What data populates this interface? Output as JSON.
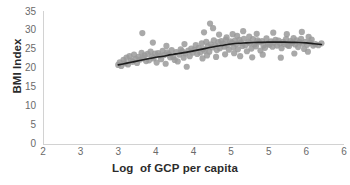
{
  "chart_data": {
    "type": "scatter",
    "title": "",
    "xlabel": "Log  of GCP per capita",
    "ylabel": "BMI Index",
    "xlim": [
      2,
      6
    ],
    "ylim": [
      0,
      35
    ],
    "grid": false,
    "legend": null,
    "xticks": [
      2,
      2.5,
      3,
      3.5,
      4,
      4.5,
      5,
      5.5,
      6
    ],
    "xtick_labels": [
      "2",
      "3",
      "3",
      "4",
      "4",
      "5",
      "5",
      "6"
    ],
    "yticks": [
      0,
      5,
      10,
      15,
      20,
      25,
      30,
      35
    ],
    "ytick_labels": [
      "0",
      "5",
      "10",
      "15",
      "20",
      "25",
      "30",
      "35"
    ],
    "marker": {
      "color": "#9a9a9a",
      "shape": "circle",
      "size": 3.1,
      "opacity": 0.85
    },
    "trendline": {
      "color": "#1c1c1c",
      "width": 1.6,
      "style": "solid",
      "kind": "smoothed-fit"
    },
    "series": [
      {
        "name": "Countries",
        "points": [
          [
            3.0,
            20.9
          ],
          [
            3.02,
            21.6
          ],
          [
            3.04,
            20.6
          ],
          [
            3.07,
            22.2
          ],
          [
            3.09,
            21.3
          ],
          [
            3.11,
            22.8
          ],
          [
            3.13,
            21.0
          ],
          [
            3.15,
            23.2
          ],
          [
            3.17,
            22.0
          ],
          [
            3.19,
            21.7
          ],
          [
            3.21,
            23.6
          ],
          [
            3.23,
            22.5
          ],
          [
            3.25,
            21.4
          ],
          [
            3.27,
            23.0
          ],
          [
            3.29,
            22.3
          ],
          [
            3.31,
            24.1
          ],
          [
            3.33,
            22.7
          ],
          [
            3.35,
            23.4
          ],
          [
            3.37,
            21.9
          ],
          [
            3.39,
            23.8
          ],
          [
            3.41,
            22.1
          ],
          [
            3.43,
            24.4
          ],
          [
            3.45,
            23.1
          ],
          [
            3.47,
            22.6
          ],
          [
            3.49,
            23.9
          ],
          [
            3.51,
            21.5
          ],
          [
            3.53,
            24.0
          ],
          [
            3.55,
            23.3
          ],
          [
            3.57,
            22.4
          ],
          [
            3.59,
            24.6
          ],
          [
            3.61,
            23.5
          ],
          [
            3.63,
            21.2
          ],
          [
            3.65,
            24.2
          ],
          [
            3.67,
            23.7
          ],
          [
            3.69,
            22.9
          ],
          [
            3.71,
            24.8
          ],
          [
            3.73,
            23.0
          ],
          [
            3.75,
            22.2
          ],
          [
            3.77,
            24.3
          ],
          [
            3.79,
            21.8
          ],
          [
            3.81,
            23.6
          ],
          [
            3.83,
            25.0
          ],
          [
            3.85,
            24.5
          ],
          [
            3.87,
            22.8
          ],
          [
            3.89,
            23.9
          ],
          [
            3.91,
            20.4
          ],
          [
            3.93,
            24.7
          ],
          [
            3.95,
            23.2
          ],
          [
            3.97,
            25.2
          ],
          [
            3.99,
            24.1
          ],
          [
            3.32,
            29.3
          ],
          [
            3.46,
            26.8
          ],
          [
            3.64,
            25.9
          ],
          [
            3.88,
            26.4
          ],
          [
            4.01,
            24.9
          ],
          [
            4.03,
            26.1
          ],
          [
            4.05,
            23.8
          ],
          [
            4.07,
            25.4
          ],
          [
            4.09,
            24.2
          ],
          [
            4.11,
            26.6
          ],
          [
            4.13,
            25.1
          ],
          [
            4.15,
            24.6
          ],
          [
            4.17,
            27.0
          ],
          [
            4.19,
            25.8
          ],
          [
            4.21,
            24.4
          ],
          [
            4.23,
            26.3
          ],
          [
            4.25,
            25.5
          ],
          [
            4.27,
            27.4
          ],
          [
            4.29,
            26.0
          ],
          [
            4.31,
            24.8
          ],
          [
            4.33,
            26.9
          ],
          [
            4.35,
            25.3
          ],
          [
            4.37,
            27.2
          ],
          [
            4.39,
            26.5
          ],
          [
            4.41,
            25.7
          ],
          [
            4.43,
            27.6
          ],
          [
            4.45,
            26.2
          ],
          [
            4.47,
            24.9
          ],
          [
            4.49,
            27.1
          ],
          [
            4.51,
            26.7
          ],
          [
            4.53,
            25.6
          ],
          [
            4.55,
            27.3
          ],
          [
            4.57,
            26.4
          ],
          [
            4.59,
            25.0
          ],
          [
            4.61,
            27.5
          ],
          [
            4.63,
            26.8
          ],
          [
            4.65,
            25.9
          ],
          [
            4.67,
            27.8
          ],
          [
            4.69,
            26.1
          ],
          [
            4.71,
            24.5
          ],
          [
            4.73,
            27.0
          ],
          [
            4.75,
            26.6
          ],
          [
            4.77,
            25.2
          ],
          [
            4.79,
            27.7
          ],
          [
            4.81,
            26.3
          ],
          [
            4.83,
            25.8
          ],
          [
            4.85,
            27.4
          ],
          [
            4.87,
            26.9
          ],
          [
            4.89,
            24.7
          ],
          [
            4.91,
            27.2
          ],
          [
            4.93,
            26.0
          ],
          [
            4.95,
            25.4
          ],
          [
            4.97,
            27.9
          ],
          [
            4.99,
            26.5
          ],
          [
            4.14,
            29.5
          ],
          [
            4.22,
            31.8
          ],
          [
            4.26,
            30.6
          ],
          [
            4.34,
            28.9
          ],
          [
            4.44,
            28.2
          ],
          [
            4.52,
            29.0
          ],
          [
            4.58,
            28.6
          ],
          [
            4.66,
            29.8
          ],
          [
            4.74,
            28.4
          ],
          [
            4.84,
            29.1
          ],
          [
            4.12,
            22.6
          ],
          [
            4.18,
            23.4
          ],
          [
            4.3,
            23.0
          ],
          [
            4.42,
            23.7
          ],
          [
            4.54,
            24.0
          ],
          [
            4.62,
            23.2
          ],
          [
            4.78,
            22.9
          ],
          [
            4.92,
            23.6
          ],
          [
            5.01,
            26.2
          ],
          [
            5.03,
            27.1
          ],
          [
            5.05,
            25.7
          ],
          [
            5.07,
            26.8
          ],
          [
            5.09,
            27.5
          ],
          [
            5.11,
            26.0
          ],
          [
            5.13,
            27.3
          ],
          [
            5.15,
            26.6
          ],
          [
            5.17,
            25.3
          ],
          [
            5.19,
            27.0
          ],
          [
            5.21,
            26.4
          ],
          [
            5.23,
            27.7
          ],
          [
            5.25,
            26.1
          ],
          [
            5.27,
            25.9
          ],
          [
            5.29,
            27.2
          ],
          [
            5.31,
            26.7
          ],
          [
            5.33,
            28.0
          ],
          [
            5.35,
            26.3
          ],
          [
            5.37,
            27.4
          ],
          [
            5.39,
            25.6
          ],
          [
            5.41,
            26.9
          ],
          [
            5.43,
            27.8
          ],
          [
            5.45,
            26.5
          ],
          [
            5.47,
            25.1
          ],
          [
            5.49,
            27.0
          ],
          [
            5.51,
            26.2
          ],
          [
            5.53,
            28.3
          ],
          [
            5.55,
            26.8
          ],
          [
            5.57,
            27.6
          ],
          [
            5.59,
            26.0
          ],
          [
            5.06,
            29.4
          ],
          [
            5.16,
            22.8
          ],
          [
            5.24,
            29.0
          ],
          [
            5.34,
            23.9
          ],
          [
            5.44,
            29.6
          ],
          [
            5.52,
            24.4
          ],
          [
            5.62,
            26.4
          ],
          [
            5.66,
            26.1
          ],
          [
            5.7,
            26.6
          ]
        ]
      }
    ],
    "trend_points": [
      [
        3.0,
        20.9
      ],
      [
        3.1,
        21.3
      ],
      [
        3.2,
        21.7
      ],
      [
        3.3,
        22.1
      ],
      [
        3.4,
        22.5
      ],
      [
        3.5,
        22.9
      ],
      [
        3.6,
        23.2
      ],
      [
        3.7,
        23.6
      ],
      [
        3.8,
        23.9
      ],
      [
        3.9,
        24.2
      ],
      [
        4.0,
        24.6
      ],
      [
        4.1,
        25.0
      ],
      [
        4.2,
        25.4
      ],
      [
        4.3,
        25.8
      ],
      [
        4.4,
        26.1
      ],
      [
        4.5,
        26.4
      ],
      [
        4.6,
        26.6
      ],
      [
        4.7,
        26.7
      ],
      [
        4.8,
        26.8
      ],
      [
        4.9,
        26.85
      ],
      [
        5.0,
        26.9
      ],
      [
        5.1,
        26.9
      ],
      [
        5.2,
        26.9
      ],
      [
        5.3,
        26.85
      ],
      [
        5.4,
        26.8
      ],
      [
        5.5,
        26.7
      ],
      [
        5.6,
        26.5
      ],
      [
        5.7,
        26.3
      ]
    ]
  }
}
